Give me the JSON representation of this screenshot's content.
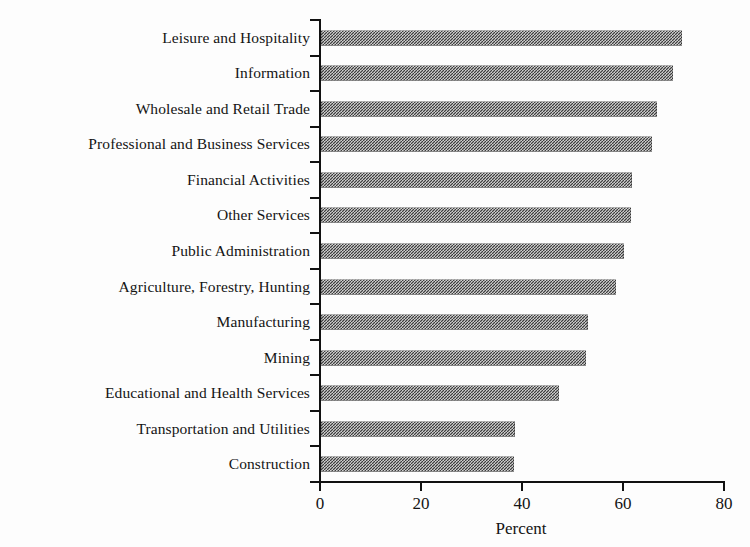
{
  "chart_data": {
    "type": "bar",
    "orientation": "horizontal",
    "title": "",
    "xlabel": "Percent",
    "ylabel": "",
    "xlim": [
      0,
      80
    ],
    "xticks": [
      0,
      20,
      40,
      60,
      80
    ],
    "grid": false,
    "legend": false,
    "categories": [
      "Leisure and Hospitality",
      "Information",
      "Wholesale and Retail Trade",
      "Professional and Business Services",
      "Financial Activities",
      "Other Services",
      "Public Administration",
      "Agriculture, Forestry, Hunting",
      "Manufacturing",
      "Mining",
      "Educational and Health Services",
      "Transportation and Utilities",
      "Construction"
    ],
    "values": [
      71.5,
      69.8,
      66.5,
      65.5,
      61.5,
      61.3,
      60.0,
      58.5,
      52.8,
      52.4,
      47.2,
      38.5,
      38.3
    ],
    "bar_color": "#3d3d3d",
    "bar_pattern": "checkerboard-dither"
  },
  "axis": {
    "x_tick_labels": [
      "0",
      "20",
      "40",
      "60",
      "80"
    ],
    "x_title": "Percent"
  }
}
